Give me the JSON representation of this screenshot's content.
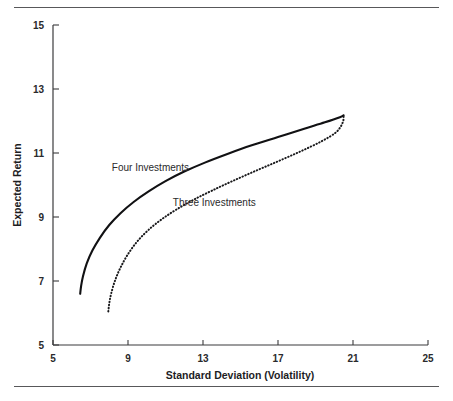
{
  "figure": {
    "name": "efficient-frontier-figure",
    "top_rule": true,
    "bottom_rule": true,
    "background_color": "#ffffff",
    "ink_color": "#111113"
  },
  "chart_data": {
    "type": "line",
    "title": "",
    "subtitle": "",
    "xlabel": "Standard Deviation (Volatility)",
    "ylabel": "Expected Return",
    "xlim": [
      5,
      25
    ],
    "ylim": [
      5,
      15
    ],
    "xticks": [
      5,
      9,
      13,
      17,
      21,
      25
    ],
    "yticks": [
      5,
      7,
      9,
      11,
      13,
      15
    ],
    "xtick_labels": [
      "5",
      "9",
      "13",
      "17",
      "21",
      "25"
    ],
    "ytick_labels": [
      "5",
      "7",
      "9",
      "11",
      "13",
      "15"
    ],
    "grid": false,
    "legend_position": "inline-annotations",
    "series": [
      {
        "name": "Four Investments",
        "style": "solid",
        "color": "#111113",
        "label_x": 10.2,
        "label_y": 10.45,
        "x": [
          6.45,
          6.5,
          6.6,
          6.8,
          7.1,
          7.5,
          8.0,
          8.6,
          9.3,
          10.1,
          11.0,
          12.0,
          13.1,
          14.3,
          15.6,
          17.0,
          18.4,
          19.5,
          20.3,
          20.5
        ],
        "y": [
          6.6,
          6.85,
          7.15,
          7.55,
          7.95,
          8.35,
          8.75,
          9.12,
          9.47,
          9.8,
          10.12,
          10.42,
          10.7,
          10.97,
          11.24,
          11.5,
          11.76,
          11.96,
          12.12,
          12.18
        ]
      },
      {
        "name": "Three Investments",
        "style": "dotted",
        "color": "#1a1a1c",
        "label_x": 13.6,
        "label_y": 9.35,
        "x": [
          7.95,
          8.0,
          8.1,
          8.3,
          8.6,
          9.0,
          9.5,
          10.1,
          10.8,
          11.6,
          12.5,
          13.5,
          14.6,
          15.8,
          17.0,
          18.2,
          19.3,
          20.1,
          20.45,
          20.5
        ],
        "y": [
          6.05,
          6.3,
          6.6,
          7.0,
          7.42,
          7.84,
          8.24,
          8.6,
          8.93,
          9.24,
          9.54,
          9.83,
          10.13,
          10.44,
          10.74,
          11.05,
          11.36,
          11.65,
          11.95,
          12.18
        ]
      }
    ]
  },
  "axes": {
    "x_axis_name": "x-axis",
    "y_axis_name": "y-axis"
  }
}
